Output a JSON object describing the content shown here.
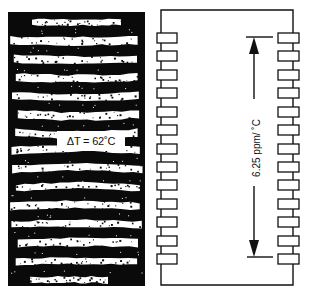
{
  "figure": {
    "left_panel": {
      "type": "interference-fringe-photo",
      "fringe_band_count": 15,
      "temperature_label": "ΔT = 62˚C"
    },
    "right_panel": {
      "type": "dual-in-line-package-outline",
      "pins_per_side": 13,
      "dimension_label": "6.25 ppm/ ˚C",
      "dimension_arrows": "double-arrow spanning top pin to bottom pin"
    }
  },
  "colors": {
    "ink": "#111111",
    "paper": "#ffffff"
  }
}
